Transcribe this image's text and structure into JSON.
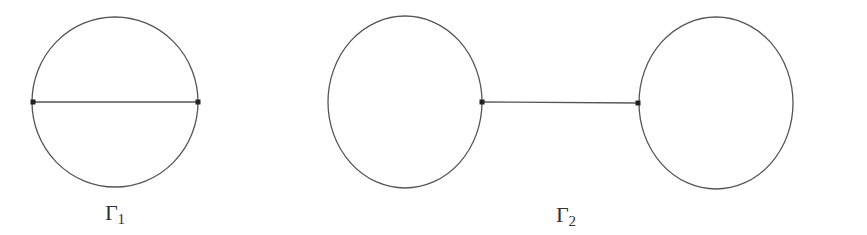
{
  "graphs": [
    {
      "id": "gamma1",
      "label": "Γ",
      "subscript": "1",
      "label_pos": [
        115,
        200
      ],
      "circles": [
        {
          "cx": 115,
          "cy": 102,
          "rx": 83,
          "ry": 85
        }
      ],
      "edges": [
        {
          "x1": 33,
          "y1": 102,
          "x2": 198,
          "y2": 102
        }
      ],
      "vertices": [
        {
          "x": 33,
          "y": 102
        },
        {
          "x": 198,
          "y": 102
        }
      ]
    },
    {
      "id": "gamma2",
      "label": "Γ",
      "subscript": "2",
      "label_pos": [
        566,
        202
      ],
      "circles": [
        {
          "cx": 405,
          "cy": 102,
          "rx": 77,
          "ry": 86
        },
        {
          "cx": 716,
          "cy": 103,
          "rx": 77,
          "ry": 86
        }
      ],
      "edges": [
        {
          "x1": 482,
          "y1": 102,
          "x2": 638,
          "y2": 103
        }
      ],
      "vertices": [
        {
          "x": 482,
          "y": 102
        },
        {
          "x": 638,
          "y": 103
        }
      ]
    }
  ],
  "style": {
    "stroke": "#555555",
    "vertex": "#222222"
  }
}
